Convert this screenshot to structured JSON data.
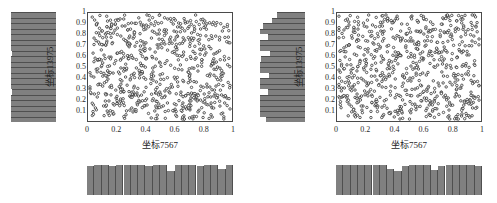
{
  "figure": {
    "background_color": "#ffffff",
    "panel_count": 2
  },
  "chart_data": [
    {
      "type": "scatter",
      "panel": "left",
      "title": "",
      "xlabel": "坐标7567",
      "ylabel": "坐标13975",
      "xlim": [
        0,
        1
      ],
      "ylim": [
        0,
        1
      ],
      "grid": false,
      "legend": null,
      "marker": "open-circle",
      "marker_color": "#1a1a1a",
      "marker_fill": "#ffffff",
      "n_points": 700,
      "xticks": [
        "0",
        "0.2",
        "0.4",
        "0.6",
        "0.8",
        "1"
      ],
      "xtick_values": [
        0,
        0.2,
        0.4,
        0.6,
        0.8,
        1
      ],
      "yticks": [
        "0.1",
        "0.2",
        "0.3",
        "0.4",
        "0.5",
        "0.6",
        "0.7",
        "0.8",
        "0.9",
        "1"
      ],
      "ytick_values": [
        0.1,
        0.2,
        0.3,
        0.4,
        0.5,
        0.6,
        0.7,
        0.8,
        0.9,
        1
      ],
      "marginal_x": {
        "orientation": "horizontal",
        "position": "bottom",
        "bar_color": "#808080",
        "bins": 20,
        "counts": [
          34,
          35,
          35,
          34,
          35,
          35,
          35,
          35,
          34,
          35,
          35,
          28,
          35,
          35,
          35,
          34,
          35,
          35,
          30,
          35
        ]
      },
      "marginal_y": {
        "orientation": "vertical",
        "position": "left",
        "bar_color": "#808080",
        "bins": 20,
        "counts": [
          35,
          35,
          35,
          35,
          35,
          34,
          35,
          35,
          35,
          35,
          35,
          35,
          34,
          35,
          35,
          35,
          35,
          35,
          35,
          35
        ]
      }
    },
    {
      "type": "scatter",
      "panel": "right",
      "title": "",
      "xlabel": "坐标7567",
      "ylabel": "坐标13975",
      "xlim": [
        0,
        1
      ],
      "ylim": [
        0,
        1
      ],
      "grid": false,
      "legend": null,
      "marker": "open-circle",
      "marker_color": "#1a1a1a",
      "marker_fill": "#ffffff",
      "n_points": 700,
      "xticks": [
        "0",
        "0.2",
        "0.4",
        "0.6",
        "0.8",
        "1"
      ],
      "xtick_values": [
        0,
        0.2,
        0.4,
        0.6,
        0.8,
        1
      ],
      "yticks": [
        "0.1",
        "0.2",
        "0.3",
        "0.4",
        "0.5",
        "0.6",
        "0.7",
        "0.8",
        "0.9",
        "1"
      ],
      "ytick_values": [
        0.1,
        0.2,
        0.3,
        0.4,
        0.5,
        0.6,
        0.7,
        0.8,
        0.9,
        1
      ],
      "marginal_x": {
        "orientation": "horizontal",
        "position": "bottom",
        "bar_color": "#808080",
        "bins": 20,
        "counts": [
          35,
          35,
          35,
          35,
          35,
          35,
          35,
          30,
          28,
          34,
          35,
          35,
          35,
          29,
          34,
          35,
          35,
          35,
          35,
          34
        ]
      },
      "marginal_y": {
        "orientation": "vertical",
        "position": "left",
        "bar_color": "#808080",
        "bins": 20,
        "counts": [
          30,
          35,
          35,
          35,
          35,
          29,
          35,
          35,
          28,
          35,
          35,
          34,
          27,
          35,
          35,
          29,
          35,
          33,
          26,
          22
        ]
      }
    }
  ]
}
